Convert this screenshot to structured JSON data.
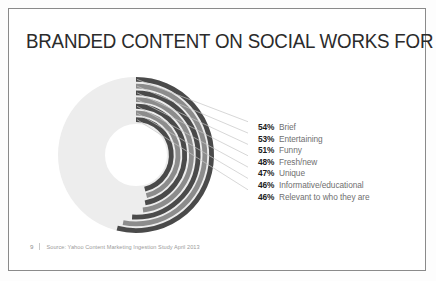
{
  "slide": {
    "title": "BRANDED CONTENT ON SOCIAL WORKS FOR MILLENNIALS IF IT IS...",
    "page_number": "9",
    "source": "Source: Yahoo Content Marketing Ingestion Study April 2013"
  },
  "colors": {
    "dark_ring": "#4a4a4a",
    "mid_ring": "#8c8c8c",
    "track": "#ededed",
    "leader_line": "#c5c5c5",
    "percent_text": "#1b1b1b",
    "label_text": "#6f6f6f",
    "title_text": "#2b2b2b",
    "border": "#8a8a8a"
  },
  "chart_data": {
    "type": "pie",
    "title": "BRANDED CONTENT ON SOCIAL WORKS FOR MILLENNIALS IF IT IS...",
    "subtype": "concentric-radial-bar",
    "categories": [
      "Brief",
      "Entertaining",
      "Funny",
      "Fresh/new",
      "Unique",
      "Informative/educational",
      "Relevant to who they are"
    ],
    "values": [
      54,
      53,
      51,
      48,
      47,
      46,
      46
    ],
    "value_suffix": "%",
    "ylim": [
      0,
      100
    ],
    "grid": false,
    "legend_position": "right",
    "ring_colors": [
      "#4a4a4a",
      "#8c8c8c",
      "#4a4a4a",
      "#8c8c8c",
      "#4a4a4a",
      "#8c8c8c",
      "#4a4a4a"
    ],
    "start_angle_deg": 0,
    "direction": "clockwise",
    "labels": [
      {
        "pct": "54%",
        "text": "Brief"
      },
      {
        "pct": "53%",
        "text": "Entertaining"
      },
      {
        "pct": "51%",
        "text": "Funny"
      },
      {
        "pct": "48%",
        "text": "Fresh/new"
      },
      {
        "pct": "47%",
        "text": "Unique"
      },
      {
        "pct": "46%",
        "text": "Informative/educational"
      },
      {
        "pct": "46%",
        "text": "Relevant to who they are"
      }
    ]
  }
}
